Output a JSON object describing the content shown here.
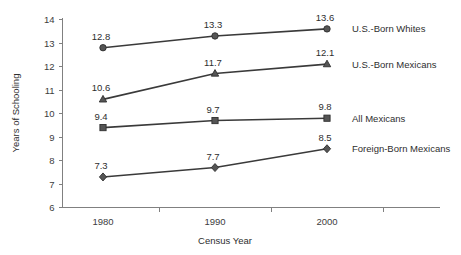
{
  "chart_data": {
    "type": "line",
    "title": "",
    "xlabel": "Census Year",
    "ylabel": "Years of Schooling",
    "categories": [
      "1980",
      "1990",
      "2000"
    ],
    "x": [
      1980,
      1990,
      2000
    ],
    "ylim": [
      6,
      14
    ],
    "yticks": [
      "6",
      "7",
      "8",
      "9",
      "10",
      "11",
      "12",
      "13",
      "14"
    ],
    "grid": false,
    "legend_position": "right-inline",
    "series": [
      {
        "name": "U.S.-Born Whites",
        "marker": "circle",
        "values": [
          12.8,
          13.3,
          13.6
        ],
        "labels": [
          "12.8",
          "13.3",
          "13.6"
        ]
      },
      {
        "name": "U.S.-Born Mexicans",
        "marker": "triangle",
        "values": [
          10.6,
          11.7,
          12.1
        ],
        "labels": [
          "10.6",
          "11.7",
          "12.1"
        ]
      },
      {
        "name": "All Mexicans",
        "marker": "square",
        "values": [
          9.4,
          9.7,
          9.8
        ],
        "labels": [
          "9.4",
          "9.7",
          "9.8"
        ]
      },
      {
        "name": "Foreign-Born Mexicans",
        "marker": "diamond",
        "values": [
          7.3,
          7.7,
          8.5
        ],
        "labels": [
          "7.3",
          "7.7",
          "8.5"
        ]
      }
    ],
    "colors": {
      "line": "#3a3a3a",
      "marker_fill": "#555555",
      "axis": "#808080",
      "text": "#2e2e2e",
      "background": "#ffffff"
    }
  },
  "legend_entries": [
    {
      "label": "U.S.-Born Whites"
    },
    {
      "label": "U.S.-Born Mexicans"
    },
    {
      "label": "All Mexicans"
    },
    {
      "label": "Foreign-Born Mexicans"
    }
  ]
}
